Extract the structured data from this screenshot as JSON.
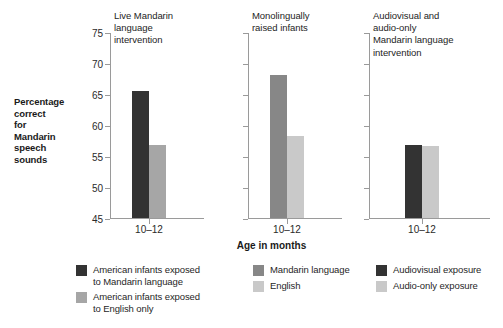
{
  "chart_data": {
    "type": "bar",
    "title": "",
    "xlabel": "Age in months",
    "ylabel": "Percentage correct for Mandarin speech sounds",
    "ylabel_lines": [
      "Percentage",
      "correct",
      "for",
      "Mandarin",
      "speech",
      "sounds"
    ],
    "ylim": [
      45,
      75
    ],
    "yticks": [
      75,
      70,
      65,
      60,
      55,
      50,
      45
    ],
    "ytick_labels": [
      "75",
      "70",
      "65",
      "60",
      "55",
      "50",
      "45"
    ],
    "categories": [
      "10–12"
    ],
    "grid": false,
    "legend_position": "bottom",
    "panels": [
      {
        "title": "Live Mandarin\nlanguage\nintervention",
        "category": "10–12",
        "show_ytick_labels": true,
        "series": [
          {
            "name": "American infants exposed to Mandarin language",
            "value": 65.5,
            "color": "#333333"
          },
          {
            "name": "American infants exposed to English only",
            "value": 56.7,
            "color": "#a6a6a6"
          }
        ]
      },
      {
        "title": "Monolingually\nraised infants",
        "category": "10–12",
        "show_ytick_labels": false,
        "series": [
          {
            "name": "Mandarin language",
            "value": 68.0,
            "color": "#878787"
          },
          {
            "name": "English",
            "value": 58.2,
            "color": "#c9c9c9"
          }
        ]
      },
      {
        "title": "Audiovisual and\naudio-only\nMandarin language\nintervention",
        "category": "10–12",
        "show_ytick_labels": false,
        "series": [
          {
            "name": "Audiovisual exposure",
            "value": 56.7,
            "color": "#333333"
          },
          {
            "name": "Audio-only exposure",
            "value": 56.6,
            "color": "#c9c9c9"
          }
        ]
      }
    ],
    "legend_columns": [
      {
        "entries": [
          {
            "label": "American infants exposed\nto Mandarin language",
            "color": "#333333"
          },
          {
            "label": "American infants exposed\nto English only",
            "color": "#a6a6a6"
          }
        ]
      },
      {
        "entries": [
          {
            "label": "Mandarin language",
            "color": "#878787"
          },
          {
            "label": "English",
            "color": "#c9c9c9"
          }
        ]
      },
      {
        "entries": [
          {
            "label": "Audiovisual exposure",
            "color": "#333333"
          },
          {
            "label": "Audio-only exposure",
            "color": "#c9c9c9"
          }
        ]
      }
    ]
  }
}
